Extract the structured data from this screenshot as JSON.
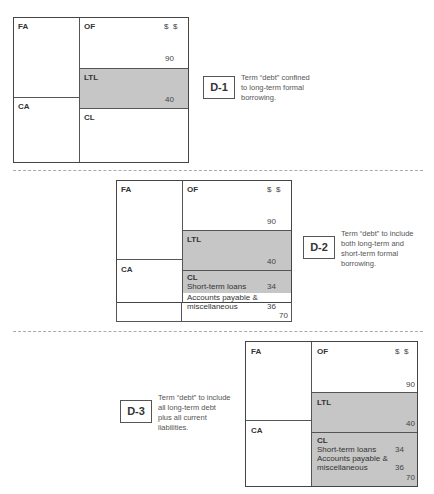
{
  "labels": {
    "fa": "FA",
    "ca": "CA",
    "of": "OF",
    "ltl": "LTL",
    "cl": "CL",
    "currency": "$  $"
  },
  "values": {
    "of": "90",
    "ltl": "40",
    "short_term_loans": "34",
    "accounts_payable": "36",
    "cl_total": "70"
  },
  "items": {
    "short_term_loans": "Short-term loans",
    "accounts_payable_1": "Accounts payable &",
    "accounts_payable_2": "miscellaneous",
    "accounts_payable_full": "Accounts payable & miscellaneous"
  },
  "diagrams": [
    {
      "id": "D-1",
      "description": "Term “debt” confined to long-term formal borrowing.",
      "desc_lines": [
        "Term “debt” confined",
        "to long-term formal",
        "borrowing."
      ]
    },
    {
      "id": "D-2",
      "description": "Term “debt” to include both long-term and short-term formal borrowing.",
      "desc_lines": [
        "Term “debt” to include",
        "both long-term and",
        "short-term formal",
        "borrowing."
      ]
    },
    {
      "id": "D-3",
      "description": "Term “debt” to include all long-term debt plus all current liabilities.",
      "desc_lines": [
        "Term “debt” to include",
        "all long-term debt",
        "plus all current",
        "liabilities."
      ]
    }
  ],
  "colors": {
    "shaded": "#c6c6c6",
    "border": "#444444"
  }
}
